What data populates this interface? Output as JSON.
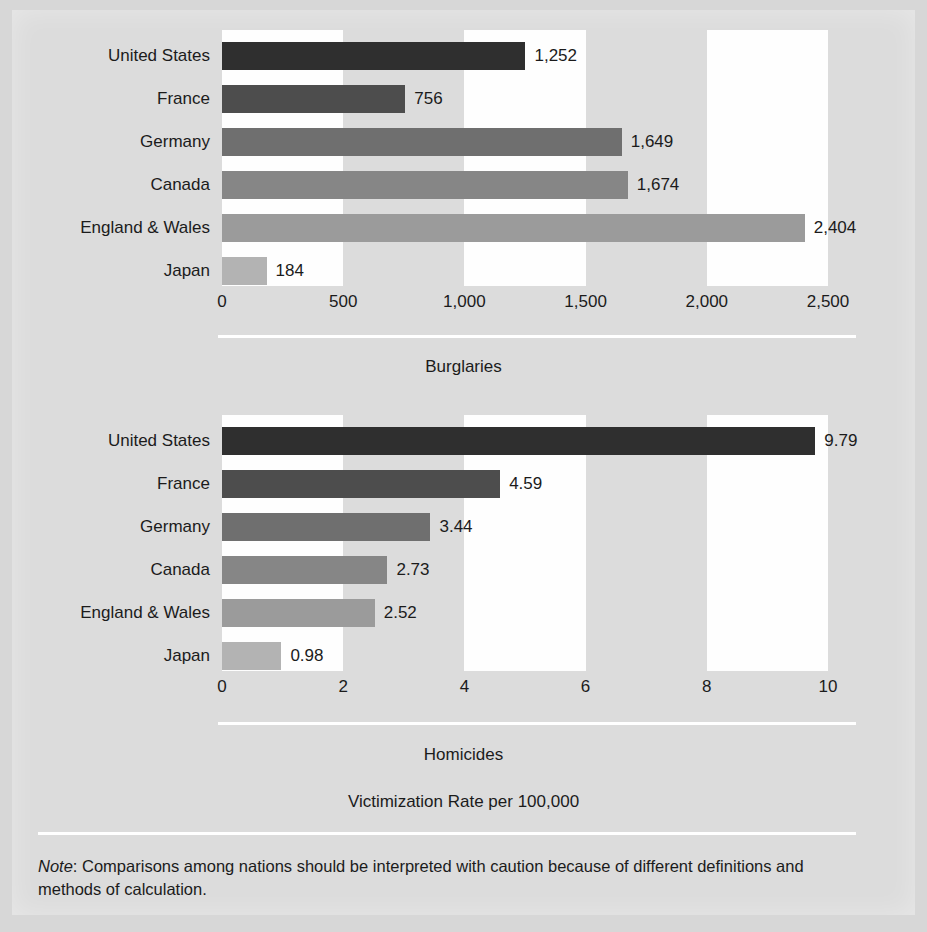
{
  "figure": {
    "axis_caption": "Victimization Rate per 100,000",
    "note_label": "Note",
    "note_text": ": Comparisons among nations should be interpreted with caution because of different definitions and methods of calculation.",
    "background_color": "#d7d7d7",
    "band_color": "#fefefe",
    "rule_color": "#ffffff"
  },
  "chart_data": [
    {
      "type": "bar",
      "orientation": "horizontal",
      "title": "Burglaries",
      "xlabel": "",
      "ylabel": "",
      "xlim": [
        0,
        2500
      ],
      "tick_values": [
        0,
        500,
        1000,
        1500,
        2000,
        2500
      ],
      "tick_labels": [
        "0",
        "500",
        "1,000",
        "1,500",
        "2,000",
        "2,500"
      ],
      "grid": false,
      "legend": "none",
      "categories": [
        "United States",
        "France",
        "Germany",
        "Canada",
        "England & Wales",
        "Japan"
      ],
      "values": [
        1252,
        756,
        1649,
        1674,
        2404,
        184
      ],
      "value_labels": [
        "1,252",
        "756",
        "1,649",
        "1,674",
        "2,404",
        "184"
      ],
      "bar_colors": [
        "#2f2f2f",
        "#4d4d4d",
        "#6f6f6f",
        "#868686",
        "#9b9b9b",
        "#b3b3b3"
      ]
    },
    {
      "type": "bar",
      "orientation": "horizontal",
      "title": "Homicides",
      "xlabel": "",
      "ylabel": "",
      "xlim": [
        0,
        10
      ],
      "tick_values": [
        0,
        2,
        4,
        6,
        8,
        10
      ],
      "tick_labels": [
        "0",
        "2",
        "4",
        "6",
        "8",
        "10"
      ],
      "grid": false,
      "legend": "none",
      "categories": [
        "United States",
        "France",
        "Germany",
        "Canada",
        "England & Wales",
        "Japan"
      ],
      "values": [
        9.79,
        4.59,
        3.44,
        2.73,
        2.52,
        0.98
      ],
      "value_labels": [
        "9.79",
        "4.59",
        "3.44",
        "2.73",
        "2.52",
        "0.98"
      ],
      "bar_colors": [
        "#2f2f2f",
        "#4d4d4d",
        "#6f6f6f",
        "#868686",
        "#9b9b9b",
        "#b3b3b3"
      ]
    }
  ]
}
